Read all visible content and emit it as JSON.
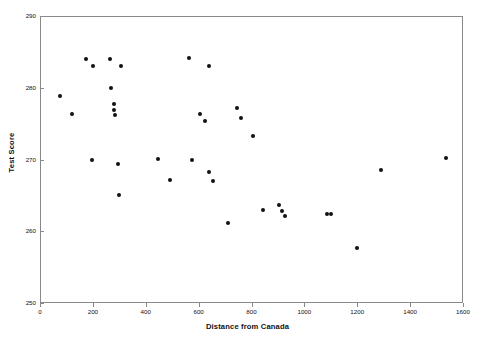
{
  "chart_data": {
    "type": "scatter",
    "title": "",
    "xlabel": "Distance from Canada",
    "ylabel": "Test Score",
    "xlim": [
      0,
      1600
    ],
    "ylim": [
      250,
      290
    ],
    "xticks": [
      0,
      200,
      400,
      600,
      800,
      1000,
      1200,
      1400,
      1600
    ],
    "yticks": [
      250,
      260,
      270,
      280,
      290
    ],
    "xtick_labels": [
      "0",
      "200",
      "400",
      "600",
      "800",
      "1000",
      "1200",
      "1400",
      "1600"
    ],
    "ytick_labels": [
      "250",
      "260",
      "270",
      "280",
      "290"
    ],
    "grid": false,
    "legend": null,
    "marker": "filled-circle",
    "marker_color": "#111111",
    "frame_color": "#8a8a8a",
    "background": "#ffffff",
    "series": [
      {
        "name": "Test Score vs Distance from Canada",
        "points": [
          {
            "x": 75,
            "y": 278.8
          },
          {
            "x": 120,
            "y": 276.3
          },
          {
            "x": 175,
            "y": 284.0
          },
          {
            "x": 200,
            "y": 283.0
          },
          {
            "x": 195,
            "y": 270.0
          },
          {
            "x": 265,
            "y": 284.0
          },
          {
            "x": 270,
            "y": 280.0
          },
          {
            "x": 280,
            "y": 277.8
          },
          {
            "x": 280,
            "y": 276.9
          },
          {
            "x": 285,
            "y": 276.2
          },
          {
            "x": 305,
            "y": 283.0
          },
          {
            "x": 295,
            "y": 269.4
          },
          {
            "x": 300,
            "y": 265.0
          },
          {
            "x": 445,
            "y": 270.1
          },
          {
            "x": 490,
            "y": 267.2
          },
          {
            "x": 565,
            "y": 284.2
          },
          {
            "x": 575,
            "y": 270.0
          },
          {
            "x": 605,
            "y": 276.4
          },
          {
            "x": 640,
            "y": 283.0
          },
          {
            "x": 625,
            "y": 275.3
          },
          {
            "x": 640,
            "y": 268.2
          },
          {
            "x": 655,
            "y": 267.0
          },
          {
            "x": 710,
            "y": 261.2
          },
          {
            "x": 745,
            "y": 277.2
          },
          {
            "x": 760,
            "y": 275.8
          },
          {
            "x": 805,
            "y": 273.3
          },
          {
            "x": 845,
            "y": 263.0
          },
          {
            "x": 905,
            "y": 263.6
          },
          {
            "x": 915,
            "y": 262.8
          },
          {
            "x": 925,
            "y": 262.1
          },
          {
            "x": 1085,
            "y": 262.4
          },
          {
            "x": 1100,
            "y": 262.4
          },
          {
            "x": 1200,
            "y": 257.6
          },
          {
            "x": 1290,
            "y": 268.6
          },
          {
            "x": 1535,
            "y": 270.2
          }
        ]
      }
    ]
  },
  "axes": {
    "x_title": "Distance from Canada",
    "y_title": "Test Score"
  }
}
